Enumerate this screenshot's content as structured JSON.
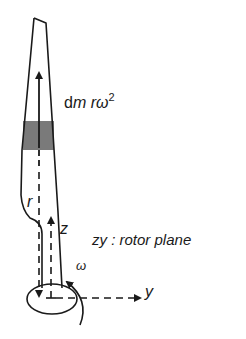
{
  "diagram": {
    "type": "rotor-blade-centrifugal-force",
    "labels": {
      "force_prefix": "d",
      "force_mass": "m",
      "force_radius": "r",
      "force_omega": "ω",
      "force_exponent": "2",
      "radius": "r",
      "z_axis": "z",
      "y_axis": "y",
      "omega": "ω",
      "plane_axes": "zy",
      "plane_sep": " : ",
      "plane_name": "rotor plane"
    },
    "colors": {
      "stroke": "#1a1a1a",
      "mass_element": "#7a7a7a",
      "background": "#ffffff"
    }
  }
}
